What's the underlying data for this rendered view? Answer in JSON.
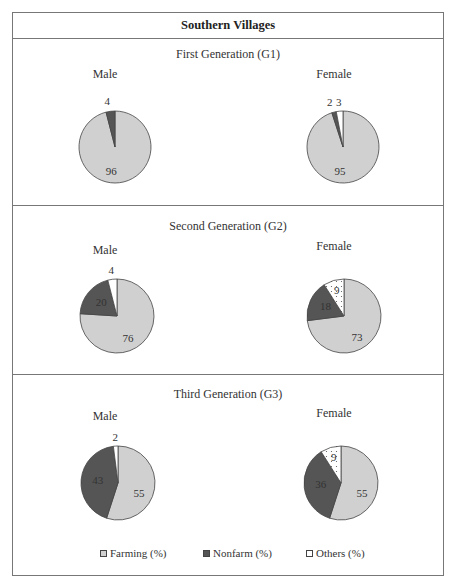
{
  "header": {
    "title": "Southern Villages"
  },
  "colors": {
    "farming": "#d0d0d0",
    "nonfarm": "#555555",
    "others": "#ffffff",
    "border": "#777777"
  },
  "legend": {
    "farming": "Farming (%)",
    "nonfarm": "Nonfarm (%)",
    "others": "Others (%)"
  },
  "panels": [
    {
      "title": "First Generation (G1)",
      "male_label": "Male",
      "female_label": "Female"
    },
    {
      "title": "Second Generation (G2)",
      "male_label": "Male",
      "female_label": "Female"
    },
    {
      "title": "Third Generation (G3)",
      "male_label": "Male",
      "female_label": "Female"
    }
  ],
  "chart_data": [
    {
      "type": "pie",
      "title": "First Generation (G1) - Male",
      "categories": [
        "Farming (%)",
        "Nonfarm (%)",
        "Others (%)"
      ],
      "values": [
        96,
        4,
        0
      ]
    },
    {
      "type": "pie",
      "title": "First Generation (G1) - Female",
      "categories": [
        "Farming (%)",
        "Nonfarm (%)",
        "Others (%)"
      ],
      "values": [
        95,
        2,
        3
      ]
    },
    {
      "type": "pie",
      "title": "Second Generation (G2) - Male",
      "categories": [
        "Farming (%)",
        "Nonfarm (%)",
        "Others (%)"
      ],
      "values": [
        76,
        20,
        4
      ]
    },
    {
      "type": "pie",
      "title": "Second Generation (G2) - Female",
      "categories": [
        "Farming (%)",
        "Nonfarm (%)",
        "Others (%)"
      ],
      "values": [
        73,
        18,
        9
      ]
    },
    {
      "type": "pie",
      "title": "Third Generation (G3) - Male",
      "categories": [
        "Farming (%)",
        "Nonfarm (%)",
        "Others (%)"
      ],
      "values": [
        55,
        43,
        2
      ]
    },
    {
      "type": "pie",
      "title": "Third Generation (G3) - Female",
      "categories": [
        "Farming (%)",
        "Nonfarm (%)",
        "Others (%)"
      ],
      "values": [
        55,
        36,
        9
      ]
    }
  ]
}
